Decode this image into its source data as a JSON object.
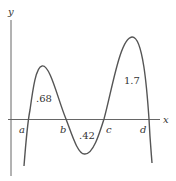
{
  "figure": {
    "axis_labels": {
      "x": "x",
      "y": "y"
    },
    "roots": [
      {
        "label": "a",
        "x": 29
      },
      {
        "label": "b",
        "x": 66
      },
      {
        "label": "c",
        "x": 104
      },
      {
        "label": "d",
        "x": 148
      }
    ],
    "areas": [
      {
        "label": ".68",
        "region": "a to b"
      },
      {
        "label": ".42",
        "region": "b to c"
      },
      {
        "label": "1.7",
        "region": "c to d"
      }
    ],
    "colors": {
      "curve": "#555555",
      "axis": "#666666"
    }
  }
}
